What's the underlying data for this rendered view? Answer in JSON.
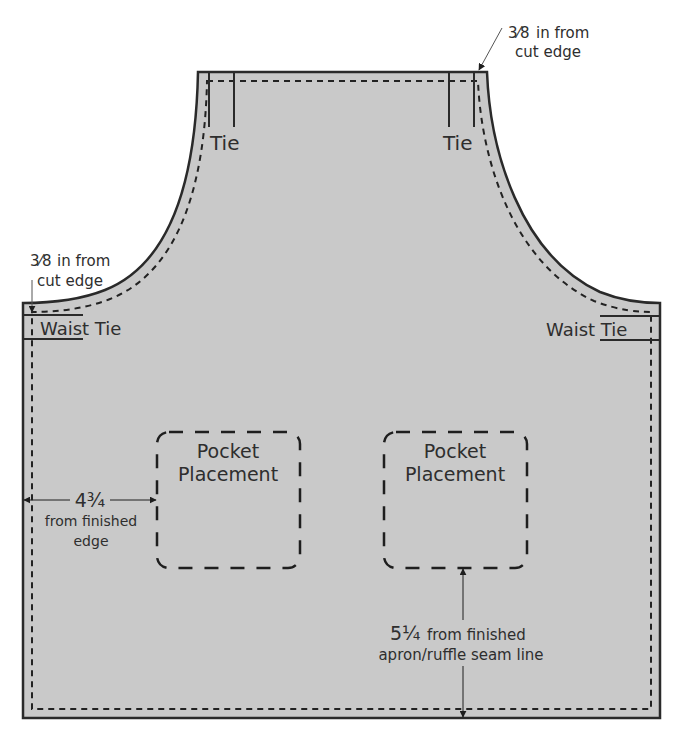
{
  "colors": {
    "fabric": "#c9c9c9",
    "outline": "#2a2a2a",
    "stitch": "#222222",
    "text": "#2e2e2e",
    "background": "#ffffff"
  },
  "annotations": {
    "seam_top_right": {
      "fraction": "3⁄8",
      "line1": "in from",
      "line2": "cut edge"
    },
    "seam_left": {
      "fraction": "3⁄8",
      "line1": "in from",
      "line2": "cut edge"
    }
  },
  "labels": {
    "tie_left": "Tie",
    "tie_right": "Tie",
    "waist_tie_left": "Waist Tie",
    "waist_tie_right": "Waist Tie"
  },
  "pockets": [
    {
      "line1": "Pocket",
      "line2": "Placement"
    },
    {
      "line1": "Pocket",
      "line2": "Placement"
    }
  ],
  "measurements": {
    "side": {
      "value": "4¾",
      "line1": "from finished",
      "line2": "edge"
    },
    "bottom": {
      "value": "5¼",
      "line1": "from finished",
      "line2": "apron/ruffle seam line"
    }
  }
}
